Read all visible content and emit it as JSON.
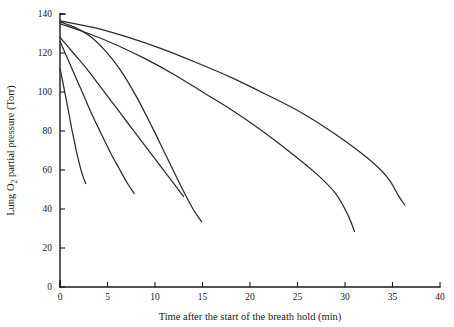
{
  "chart_data": {
    "type": "line",
    "title": "",
    "xlabel": "Time after the start of the breath hold (min)",
    "ylabel": "Lung O2 partial pressure (Torr)",
    "ylabel_parts": {
      "prefix": "Lung O",
      "subscript": "2",
      "suffix": " partial pressure (Torr)"
    },
    "xlim": [
      0,
      40
    ],
    "ylim": [
      0,
      140
    ],
    "xticks": [
      0,
      5,
      10,
      15,
      20,
      25,
      30,
      35,
      40
    ],
    "xtick_labels": [
      "0",
      "5",
      "10",
      "15",
      "20",
      "25",
      "30",
      "35",
      "40"
    ],
    "yticks": [
      0,
      20,
      40,
      60,
      80,
      100,
      120,
      140
    ],
    "ytick_labels": [
      "0",
      "20",
      "40",
      "60",
      "80",
      "100",
      "120",
      "140"
    ],
    "grid": false,
    "legend": "none",
    "line_color": "#2b2b2b",
    "axis_color": "#1a1a1a",
    "background": "#ffffff",
    "series": [
      {
        "name": "curve-1-shortest-breath-hold",
        "x": [
          0.0,
          0.3,
          0.6,
          0.9,
          1.2,
          1.5,
          1.8,
          2.1,
          2.4,
          2.7
        ],
        "y": [
          112.0,
          105.0,
          97.5,
          90.0,
          82.0,
          75.0,
          68.0,
          62.0,
          57.0,
          53.0
        ]
      },
      {
        "name": "curve-2",
        "x": [
          0.0,
          0.8,
          1.7,
          2.6,
          3.5,
          4.4,
          5.3,
          6.2,
          7.0,
          7.8
        ],
        "y": [
          126.0,
          117.0,
          107.0,
          97.0,
          87.0,
          78.0,
          69.0,
          61.0,
          54.0,
          48.0
        ]
      },
      {
        "name": "curve-3",
        "x": [
          0.0,
          1.4,
          2.8,
          4.2,
          5.6,
          7.0,
          8.4,
          9.8,
          11.2,
          12.6,
          13.0
        ],
        "y": [
          128.0,
          120.0,
          112.0,
          103.0,
          94.0,
          85.0,
          76.0,
          67.0,
          58.0,
          49.0,
          46.5
        ]
      },
      {
        "name": "curve-4",
        "x": [
          0.0,
          1.6,
          3.2,
          4.8,
          6.4,
          8.0,
          9.6,
          11.2,
          12.8,
          14.0,
          14.9
        ],
        "y": [
          136.0,
          133.0,
          128.5,
          121.0,
          111.0,
          98.0,
          83.0,
          67.0,
          51.0,
          40.0,
          33.5
        ]
      },
      {
        "name": "curve-5",
        "x": [
          0.0,
          3.0,
          6.0,
          9.0,
          12.0,
          15.0,
          18.0,
          21.0,
          24.0,
          27.0,
          29.0,
          30.3,
          31.0
        ],
        "y": [
          135.0,
          130.0,
          124.0,
          117.0,
          109.0,
          100.0,
          91.0,
          81.0,
          70.0,
          58.0,
          48.0,
          37.0,
          28.5
        ]
      },
      {
        "name": "curve-6-longest-breath-hold",
        "x": [
          0.0,
          3.6,
          7.2,
          10.8,
          14.4,
          18.0,
          21.6,
          25.2,
          28.8,
          32.4,
          34.5,
          35.6,
          36.3
        ],
        "y": [
          136.5,
          133.0,
          128.0,
          122.0,
          115.0,
          107.5,
          99.0,
          90.0,
          79.0,
          66.0,
          56.0,
          47.0,
          42.0
        ]
      }
    ]
  }
}
